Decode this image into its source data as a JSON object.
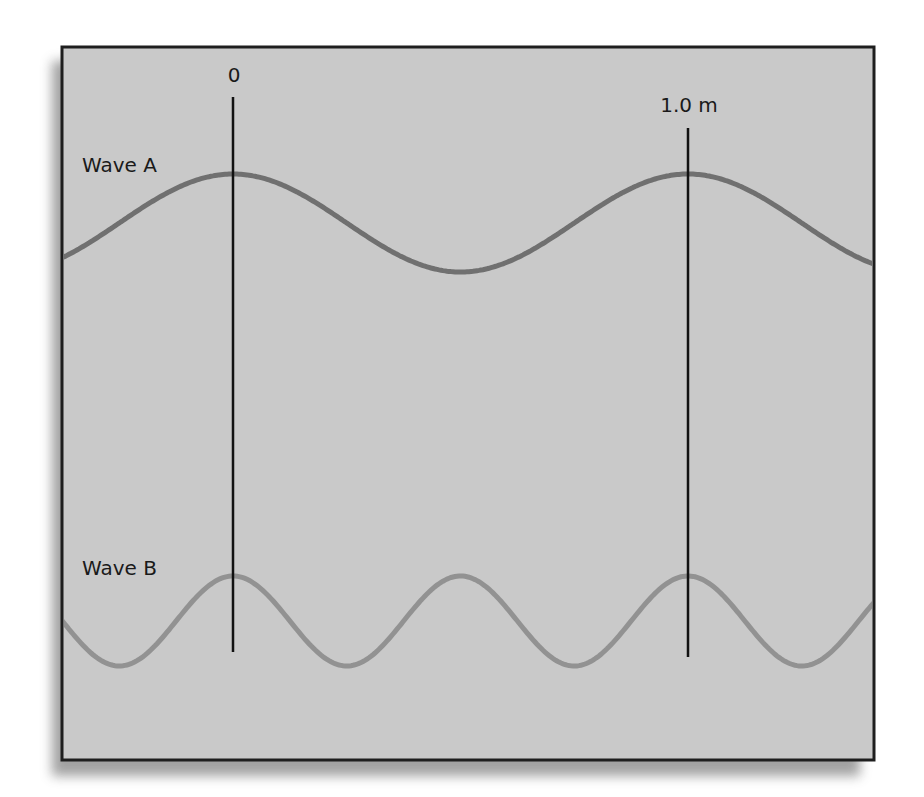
{
  "figure": {
    "frame": {
      "x": 62,
      "y": 47,
      "width": 812,
      "height": 713,
      "fill": "#c9c9c9",
      "border": "#1e1e1e"
    },
    "markers": [
      {
        "label": "0",
        "x": 233,
        "y1": 97,
        "y2": 652,
        "label_x": 234,
        "label_y": 82
      },
      {
        "label": "1.0 m",
        "x": 688,
        "y1": 128,
        "y2": 657,
        "label_x": 689,
        "label_y": 112
      }
    ],
    "waves": [
      {
        "name": "Wave A",
        "label_x": 82,
        "label_y": 172,
        "color": "#707070",
        "stroke_width": 5,
        "crest_x": 233,
        "wavelength_px": 455,
        "center_y": 223,
        "amplitude_px": 49
      },
      {
        "name": "Wave B",
        "label_x": 82,
        "label_y": 575,
        "color": "#929292",
        "stroke_width": 5,
        "crest_x": 233,
        "wavelength_px": 227.5,
        "center_y": 621,
        "amplitude_px": 45
      }
    ]
  },
  "chart_data": {
    "type": "line",
    "title": "",
    "xlabel": "position (m)",
    "ylabel": "",
    "markers": [
      {
        "label": "0",
        "x_m": 0
      },
      {
        "label": "1.0 m",
        "x_m": 1.0
      }
    ],
    "series": [
      {
        "name": "Wave A",
        "wavelength_m": 1.0,
        "crests_at_m": [
          0,
          1.0
        ],
        "troughs_at_m": [
          0.5
        ]
      },
      {
        "name": "Wave B",
        "wavelength_m": 0.5,
        "crests_at_m": [
          0,
          0.5,
          1.0
        ],
        "troughs_at_m": [
          -0.25,
          0.25,
          0.75,
          1.25
        ]
      }
    ],
    "grid": false,
    "legend": "inline labels at left"
  }
}
